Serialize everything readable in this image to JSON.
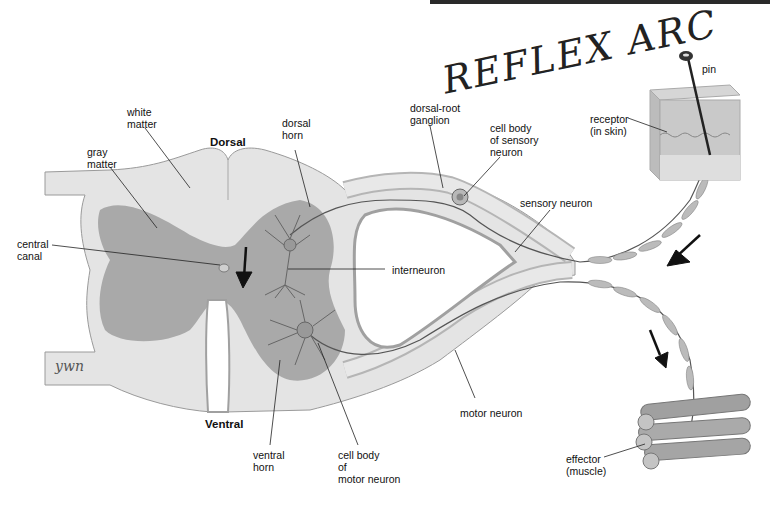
{
  "title_handwritten": "REFLEX ARC",
  "signature": "ywn",
  "orientation": {
    "dorsal": "Dorsal",
    "ventral": "Ventral"
  },
  "labels": {
    "white_matter": "white\nmatter",
    "gray_matter": "gray\nmatter",
    "central_canal": "central\ncanal",
    "dorsal_horn": "dorsal\nhorn",
    "dorsal_root_ganglion": "dorsal-root\nganglion",
    "cell_body_sensory": "cell body\nof sensory\nneuron",
    "sensory_neuron": "sensory neuron",
    "interneuron": "interneuron",
    "motor_neuron": "motor neuron",
    "ventral_horn": "ventral\nhorn",
    "cell_body_motor": "cell body\nof\nmotor neuron",
    "pin": "pin",
    "receptor": "receptor\n(in skin)",
    "effector": "effector\n(muscle)"
  },
  "colors": {
    "white_matter": "#e4e4e4",
    "gray_matter": "#a9a9a9",
    "outline": "#8a8a8a",
    "nerve": "#555555",
    "arrow": "#111111"
  }
}
